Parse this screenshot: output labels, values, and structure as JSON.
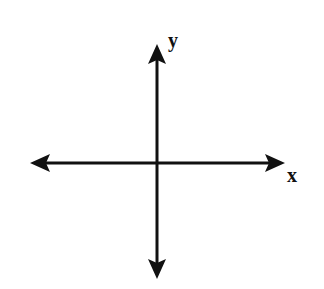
{
  "diagram": {
    "x_axis": {
      "label": "x",
      "from": [
        30,
        163
      ],
      "to": [
        285,
        163
      ]
    },
    "y_axis": {
      "label": "y",
      "from": [
        157,
        279
      ],
      "to": [
        157,
        44
      ]
    },
    "origin": [
      157,
      163
    ],
    "stroke_color": "#111111",
    "background": "#ffffff"
  }
}
